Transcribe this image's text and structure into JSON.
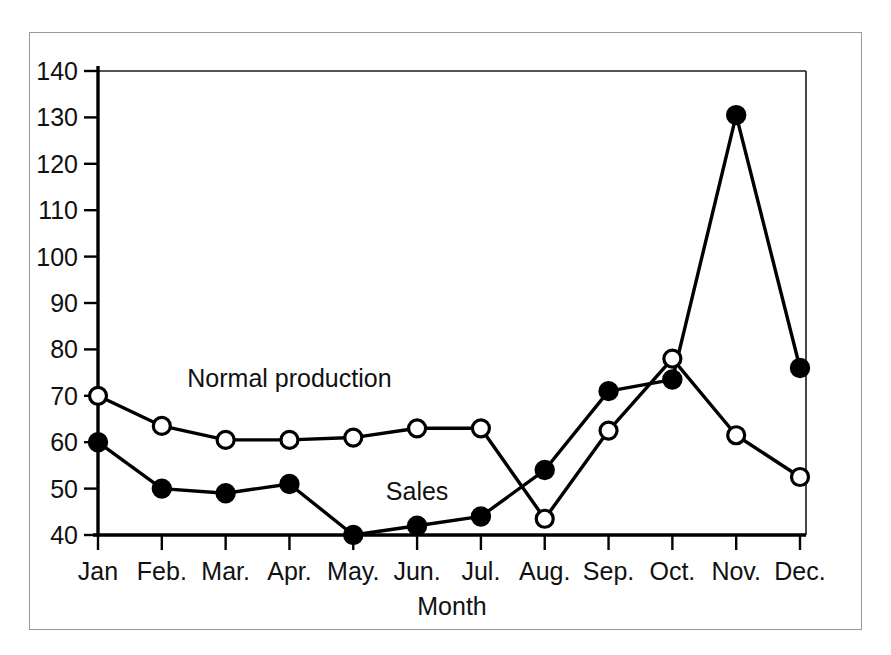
{
  "chart_data": {
    "type": "line",
    "title": "",
    "xlabel": "Month",
    "ylabel": "",
    "categories": [
      "Jan",
      "Feb.",
      "Mar.",
      "Apr.",
      "May.",
      "Jun.",
      "Jul.",
      "Aug.",
      "Sep.",
      "Oct.",
      "Nov.",
      "Dec."
    ],
    "ylim": [
      40,
      140
    ],
    "yticks": [
      40,
      50,
      60,
      70,
      80,
      90,
      100,
      110,
      120,
      130,
      140
    ],
    "grid": false,
    "legend_position": "inline-annotations",
    "series": [
      {
        "name": "Normal production",
        "marker": "open-circle",
        "color": "#000000",
        "values": [
          70,
          63.5,
          60.5,
          60.5,
          61,
          63,
          63,
          43.5,
          62.5,
          78,
          61.5,
          52.5
        ]
      },
      {
        "name": "Sales",
        "marker": "filled-circle",
        "color": "#000000",
        "values": [
          60,
          50,
          49,
          51,
          40,
          42,
          44,
          54,
          71,
          73.5,
          130.5,
          76
        ]
      }
    ],
    "annotations": [
      {
        "text": "Normal production",
        "series": "Normal production",
        "x_value": "Apr.",
        "y_value": 72
      },
      {
        "text": "Sales",
        "series": "Sales",
        "x_value": "Jun.",
        "y_value": 47.5
      }
    ]
  }
}
